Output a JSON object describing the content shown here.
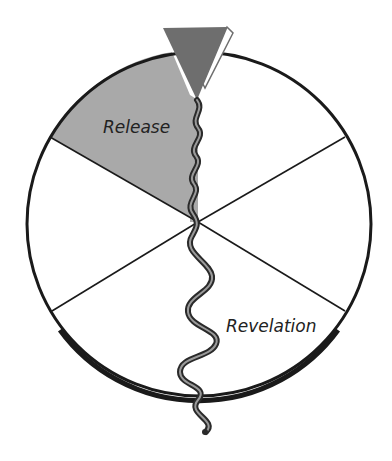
{
  "diagram": {
    "type": "wheel",
    "segments": 6,
    "labels": {
      "release": "Release",
      "revelation": "Revelation"
    },
    "highlighted_segment": "Release",
    "colors": {
      "background": "#ffffff",
      "outline": "#1a1a1a",
      "highlight_fill": "#a9a9a9",
      "funnel_fill": "#6e6e6e",
      "thread_stroke": "#2a2a2a",
      "label_text": "#222222"
    }
  }
}
